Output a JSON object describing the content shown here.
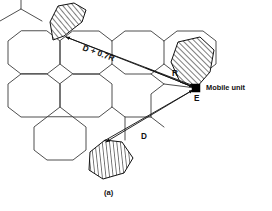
{
  "figure": {
    "caption": "(a)",
    "type": "cellular-cochannel-interference-diagram",
    "stroke_color": "#3a3a3a",
    "ink_color": "#111111",
    "background": "#ffffff"
  },
  "labels": {
    "distance_d_plus_r": "D + 0.7R",
    "cell_radius": "R",
    "reuse_distance": "D",
    "mobile_point": "E",
    "mobile_unit": "Mobile unit"
  },
  "icons": {
    "mobile_marker": "filled-square-marker",
    "cochannel_fill": "diagonal-hatch-pattern"
  },
  "geometry": {
    "hex_radius": 26,
    "grid_note": "flat-top hexagonal cell cluster",
    "cells": [
      {
        "name": "cell-top-left",
        "cx": 34,
        "cy": 42,
        "hatched": false
      },
      {
        "name": "cell-mid-left",
        "cx": 34,
        "cy": 87,
        "hatched": false
      },
      {
        "name": "cell-center-upper",
        "cx": 73,
        "cy": 65,
        "hatched": false
      },
      {
        "name": "cell-center-lower",
        "cx": 73,
        "cy": 110,
        "hatched": false
      },
      {
        "name": "cell-bottom-left",
        "cx": 73,
        "cy": 155,
        "hatched": false
      },
      {
        "name": "cell-right-upper",
        "cx": 112,
        "cy": 87,
        "hatched": false
      },
      {
        "name": "cell-far-right",
        "cx": 151,
        "cy": 65,
        "hatched": false
      },
      {
        "name": "cell-cochannel-top",
        "cx": 73,
        "cy": 20,
        "hatched": true
      },
      {
        "name": "cell-cochannel-right",
        "cx": 190,
        "cy": 44,
        "hatched": true
      },
      {
        "name": "cell-cochannel-bottom",
        "cx": 112,
        "cy": 155,
        "hatched": true
      }
    ],
    "mobile_unit_point": {
      "x": 196,
      "y": 88
    },
    "measure_lines": [
      {
        "name": "line-d-plus-0.7r",
        "from": [
          64,
          36
        ],
        "to": [
          196,
          88
        ],
        "label": "D + 0.7R"
      },
      {
        "name": "line-r",
        "from": [
          148,
          70
        ],
        "to": [
          196,
          88
        ],
        "label": "R"
      },
      {
        "name": "line-d",
        "from": [
          105,
          140
        ],
        "to": [
          196,
          88
        ],
        "label": "D"
      }
    ]
  }
}
